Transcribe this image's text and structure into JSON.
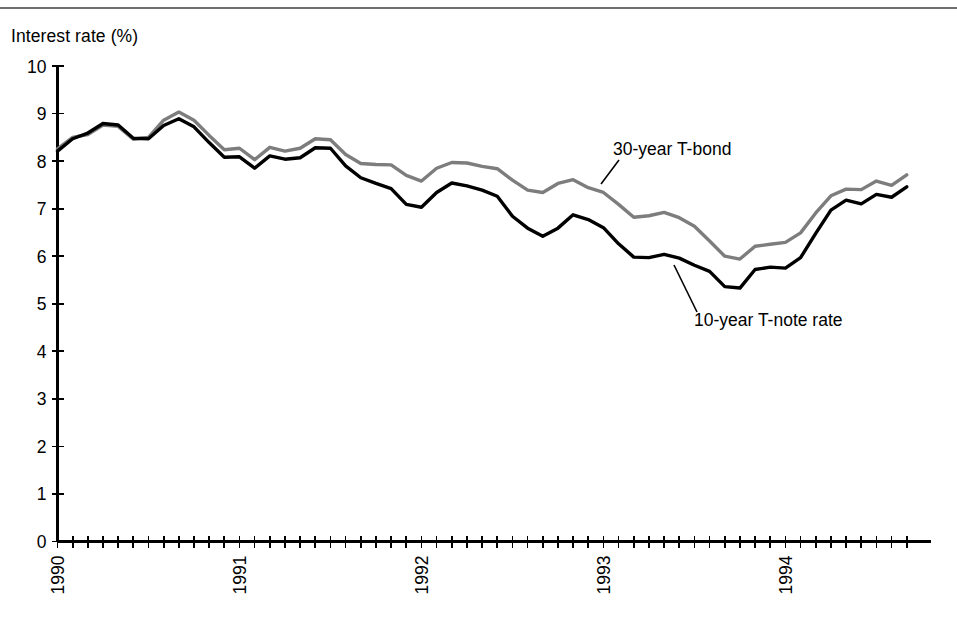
{
  "figure": {
    "axis_title": "Interest rate (%)",
    "background_color": "#ffffff"
  },
  "chart_data": {
    "type": "line",
    "title": "",
    "subtitle": "",
    "xlabel": "",
    "ylabel": "Interest rate (%)",
    "ylim": [
      0,
      10
    ],
    "ytick_labels": [
      "0",
      "1",
      "2",
      "3",
      "4",
      "5",
      "6",
      "7",
      "8",
      "9",
      "10"
    ],
    "ytick_values": [
      0,
      1,
      2,
      3,
      4,
      5,
      6,
      7,
      8,
      9,
      10
    ],
    "xlim": [
      "1990-01",
      "1994-09"
    ],
    "xtick_labels": [
      "1990",
      "1991",
      "1992",
      "1993",
      "1994"
    ],
    "xtick_label_rotation": -90,
    "x_minor_ticks": "monthly",
    "grid": false,
    "legend": "inline annotations",
    "x": [
      "1990-01",
      "1990-02",
      "1990-03",
      "1990-04",
      "1990-05",
      "1990-06",
      "1990-07",
      "1990-08",
      "1990-09",
      "1990-10",
      "1990-11",
      "1990-12",
      "1991-01",
      "1991-02",
      "1991-03",
      "1991-04",
      "1991-05",
      "1991-06",
      "1991-07",
      "1991-08",
      "1991-09",
      "1991-10",
      "1991-11",
      "1991-12",
      "1992-01",
      "1992-02",
      "1992-03",
      "1992-04",
      "1992-05",
      "1992-06",
      "1992-07",
      "1992-08",
      "1992-09",
      "1992-10",
      "1992-11",
      "1992-12",
      "1993-01",
      "1993-02",
      "1993-03",
      "1993-04",
      "1993-05",
      "1993-06",
      "1993-07",
      "1993-08",
      "1993-09",
      "1993-10",
      "1993-11",
      "1993-12",
      "1994-01",
      "1994-02",
      "1994-03",
      "1994-04",
      "1994-05",
      "1994-06",
      "1994-07",
      "1994-08",
      "1994-09"
    ],
    "series": [
      {
        "name": "30-year T-bond",
        "color": "#7d7d7d",
        "values": [
          8.26,
          8.5,
          8.56,
          8.76,
          8.73,
          8.46,
          8.5,
          8.86,
          9.03,
          8.86,
          8.54,
          8.24,
          8.27,
          8.03,
          8.29,
          8.21,
          8.27,
          8.47,
          8.45,
          8.14,
          7.95,
          7.93,
          7.92,
          7.7,
          7.58,
          7.85,
          7.97,
          7.96,
          7.89,
          7.84,
          7.6,
          7.39,
          7.34,
          7.53,
          7.61,
          7.44,
          7.34,
          7.09,
          6.82,
          6.85,
          6.92,
          6.81,
          6.63,
          6.32,
          6.0,
          5.94,
          6.21,
          6.25,
          6.29,
          6.49,
          6.91,
          7.27,
          7.41,
          7.4,
          7.58,
          7.49,
          7.71
        ]
      },
      {
        "name": "10-year T-note rate",
        "color": "#000000",
        "values": [
          8.21,
          8.47,
          8.59,
          8.79,
          8.76,
          8.48,
          8.47,
          8.75,
          8.89,
          8.72,
          8.39,
          8.08,
          8.09,
          7.85,
          8.11,
          8.04,
          8.07,
          8.28,
          8.27,
          7.9,
          7.65,
          7.53,
          7.42,
          7.09,
          7.03,
          7.34,
          7.54,
          7.48,
          7.39,
          7.26,
          6.84,
          6.59,
          6.42,
          6.59,
          6.87,
          6.77,
          6.6,
          6.26,
          5.98,
          5.97,
          6.04,
          5.96,
          5.81,
          5.68,
          5.36,
          5.33,
          5.72,
          5.77,
          5.75,
          5.97,
          6.48,
          6.97,
          7.18,
          7.1,
          7.3,
          7.24,
          7.46
        ]
      }
    ],
    "annotations": [
      {
        "text": "30-year T-bond",
        "series": "30-year T-bond",
        "label_x": 613,
        "label_y": 155,
        "leader_from_x": 601,
        "leader_from_y": 184,
        "leader_to_x": 619,
        "leader_to_y": 160
      },
      {
        "text": "10-year T-note rate",
        "series": "10-year T-note rate",
        "label_x": 694,
        "label_y": 326,
        "leader_from_x": 674,
        "leader_from_y": 265,
        "leader_to_x": 697,
        "leader_to_y": 312
      }
    ]
  }
}
